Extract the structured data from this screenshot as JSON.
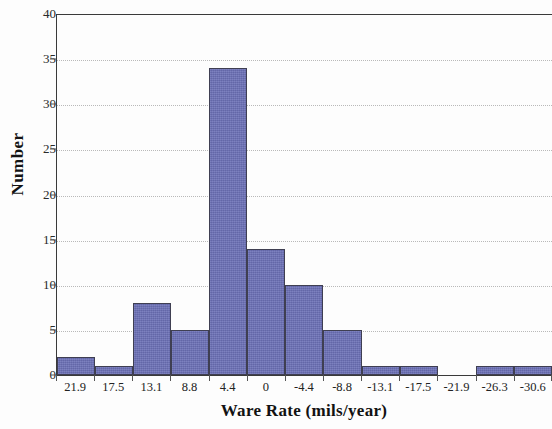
{
  "chart_data": {
    "type": "bar",
    "title": "",
    "xlabel": "Ware Rate (mils/year)",
    "ylabel": "Number",
    "categories": [
      "21.9",
      "17.5",
      "13.1",
      "8.8",
      "4.4",
      "0",
      "-4.4",
      "-8.8",
      "-13.1",
      "-17.5",
      "-21.9",
      "-26.3",
      "-30.6"
    ],
    "values": [
      2,
      1,
      8,
      5,
      34,
      14,
      10,
      5,
      1,
      1,
      0,
      1,
      1
    ],
    "ylim": [
      0,
      40
    ],
    "yticks": [
      0,
      5,
      10,
      15,
      20,
      25,
      30,
      35,
      40
    ],
    "ytick_labels": [
      "0",
      "5",
      "10",
      "15",
      "20",
      "25",
      "30",
      "35",
      "40"
    ],
    "grid": true,
    "grid_axis": "y",
    "legend": "none",
    "bar_color": "#6b70b6",
    "bar_edge_color": "#3f3f52",
    "axis_color": "#3a3a3a",
    "grid_color": "#b9b9b9"
  }
}
